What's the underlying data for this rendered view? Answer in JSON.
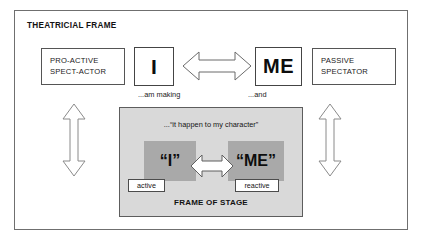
{
  "diagram": {
    "title": "THEATRICIAL FRAME",
    "colors": {
      "frame_border": "#6f6f6f",
      "box_border": "#555555",
      "stage_background": "#d9d9d9",
      "stage_block_background": "#a9a9a9",
      "arrow_fill": "#ffffff",
      "arrow_stroke": "#6b6b6b",
      "text": "#1a1a1a"
    },
    "left_box": {
      "line1": "PRO-ACTIVE",
      "line2": "SPECT-ACTOR"
    },
    "right_box": {
      "line1": "PASSIVE",
      "line2": "SPECTATOR"
    },
    "letter_i": "I",
    "letter_me": "ME",
    "caption_am_making": "...am making",
    "caption_and": "...and",
    "stage": {
      "quote": "...“it happen to my character”",
      "block_i": "“I”",
      "block_me": "“ME”",
      "pill_active": "active",
      "pill_reactive": "reactive",
      "caption": "FRAME OF STAGE"
    },
    "arrows": {
      "top_center": "double-headed-horizontal-arrow",
      "left_vertical": "double-headed-vertical-arrow",
      "right_vertical": "double-headed-vertical-arrow",
      "stage_center": "double-headed-horizontal-arrow"
    }
  }
}
